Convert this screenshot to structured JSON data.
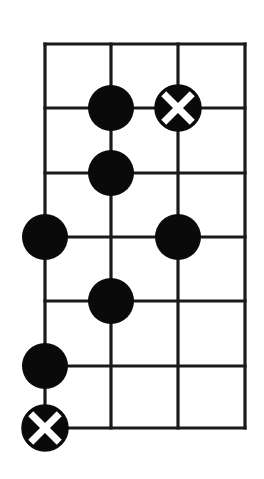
{
  "diagram": {
    "type": "chord-fretboard-diagram",
    "strings": 4,
    "frets": 6,
    "grid": {
      "x": [
        45,
        111,
        178,
        245
      ],
      "y": [
        44,
        108,
        173,
        237,
        301,
        366,
        428
      ]
    },
    "line_color": "#1a1a1a",
    "dot_color": "#0a0a0a",
    "mark_color": "#ffffff",
    "dot_radius": 23,
    "markers": [
      {
        "string": 1,
        "line": 1,
        "kind": "dot"
      },
      {
        "string": 2,
        "line": 1,
        "kind": "x"
      },
      {
        "string": 1,
        "line": 2,
        "kind": "dot"
      },
      {
        "string": 0,
        "line": 3,
        "kind": "dot"
      },
      {
        "string": 2,
        "line": 3,
        "kind": "dot"
      },
      {
        "string": 1,
        "line": 4,
        "kind": "dot"
      },
      {
        "string": 0,
        "line": 5,
        "kind": "dot"
      },
      {
        "string": 0,
        "line": 6,
        "kind": "x"
      }
    ]
  }
}
